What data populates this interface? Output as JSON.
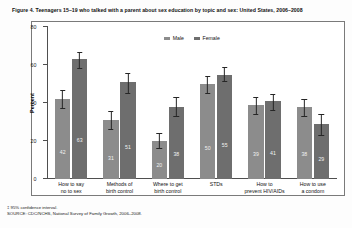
{
  "figure": {
    "title": "Figure 4. Teenagers 15–19 who talked with a parent about sex education by topic and sex: United States, 2006–2008",
    "ylabel": "Percent"
  },
  "legend": {
    "items": [
      {
        "label": "Male",
        "color": "#8c8c8c"
      },
      {
        "label": "Female",
        "color": "#6e6e6e"
      }
    ]
  },
  "axis": {
    "yticks": [
      "0",
      "20",
      "40",
      "60",
      "80"
    ]
  },
  "footnotes": {
    "ci_symbol": "‡",
    "ci_note": "95% confidence interval.",
    "source": "SOURCE: CDC/NCHS, National Survey of Family Growth, 2006–2008."
  },
  "chart_data": {
    "type": "bar",
    "title": "Figure 4. Teenagers 15–19 who talked with a parent about sex education by topic and sex: United States, 2006–2008",
    "xlabel": "",
    "ylabel": "Percent",
    "ylim": [
      0,
      80
    ],
    "yticks": [
      0,
      20,
      40,
      60,
      80
    ],
    "grid": false,
    "legend_position": "top-center",
    "error_bars": "95% confidence interval",
    "categories": [
      "How to say no to sex",
      "Methods of birth control",
      "Where to get birth control",
      "STDs",
      "How to prevent HIV/AIDs",
      "How to use a condom"
    ],
    "series": [
      {
        "name": "Male",
        "color": "#8c8c8c",
        "values": [
          42,
          31,
          20,
          50,
          39,
          38
        ],
        "ci_low": [
          37,
          26,
          16,
          45,
          34,
          33
        ],
        "ci_high": [
          47,
          36,
          24,
          54,
          43,
          42
        ]
      },
      {
        "name": "Female",
        "color": "#6e6e6e",
        "values": [
          63,
          51,
          38,
          55,
          41,
          29
        ],
        "ci_low": [
          58,
          45,
          33,
          51,
          36,
          23
        ],
        "ci_high": [
          67,
          56,
          43,
          59,
          45,
          34
        ]
      }
    ]
  }
}
